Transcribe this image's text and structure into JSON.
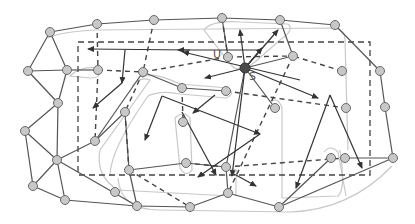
{
  "diagram": {
    "title": "",
    "labels": [
      {
        "id": "U",
        "text": "U",
        "x": 217,
        "y": 55
      },
      {
        "id": "S",
        "text": "S",
        "x": 251,
        "y": 76
      }
    ],
    "colors": {
      "node_fill": "#c8c8c8",
      "node_stroke": "#6a6a6a",
      "highlight_node": "#4a4a4a",
      "edge": "#555555",
      "dashed": "#444444",
      "arrow": "#333333",
      "contour": "#c4c4c4"
    },
    "dashed_rect": {
      "x1": 78,
      "y1": 42,
      "x2": 370,
      "y2": 175
    },
    "nodes": [
      {
        "id": "n1",
        "x": 50,
        "y": 32
      },
      {
        "id": "n2",
        "x": 97,
        "y": 24
      },
      {
        "id": "n3",
        "x": 154,
        "y": 20
      },
      {
        "id": "n4",
        "x": 222,
        "y": 18
      },
      {
        "id": "n5",
        "x": 280,
        "y": 20
      },
      {
        "id": "n6",
        "x": 335,
        "y": 25
      },
      {
        "id": "n7",
        "x": 28,
        "y": 71
      },
      {
        "id": "n8",
        "x": 67,
        "y": 70
      },
      {
        "id": "n9",
        "x": 98,
        "y": 70
      },
      {
        "id": "n10",
        "x": 143,
        "y": 72
      },
      {
        "id": "n11",
        "x": 58,
        "y": 103
      },
      {
        "id": "n12",
        "x": 228,
        "y": 57
      },
      {
        "id": "n13",
        "x": 245,
        "y": 68
      },
      {
        "id": "n14",
        "x": 293,
        "y": 56
      },
      {
        "id": "n15",
        "x": 182,
        "y": 88
      },
      {
        "id": "n16",
        "x": 226,
        "y": 91
      },
      {
        "id": "n17",
        "x": 275,
        "y": 108
      },
      {
        "id": "n18",
        "x": 342,
        "y": 71
      },
      {
        "id": "n19",
        "x": 346,
        "y": 108
      },
      {
        "id": "n20",
        "x": 125,
        "y": 112
      },
      {
        "id": "n21",
        "x": 95,
        "y": 141
      },
      {
        "id": "n22",
        "x": 183,
        "y": 122
      },
      {
        "id": "n23",
        "x": 25,
        "y": 131
      },
      {
        "id": "n24",
        "x": 57,
        "y": 160
      },
      {
        "id": "n25",
        "x": 33,
        "y": 186
      },
      {
        "id": "n26",
        "x": 65,
        "y": 200
      },
      {
        "id": "n27",
        "x": 115,
        "y": 192
      },
      {
        "id": "n28",
        "x": 129,
        "y": 170
      },
      {
        "id": "n29",
        "x": 186,
        "y": 163
      },
      {
        "id": "n30",
        "x": 137,
        "y": 206
      },
      {
        "id": "n31",
        "x": 190,
        "y": 207
      },
      {
        "id": "n32",
        "x": 226,
        "y": 167
      },
      {
        "id": "n33",
        "x": 228,
        "y": 193
      },
      {
        "id": "n34",
        "x": 279,
        "y": 207
      },
      {
        "id": "n35",
        "x": 331,
        "y": 158
      },
      {
        "id": "n36",
        "x": 345,
        "y": 158
      },
      {
        "id": "n37",
        "x": 380,
        "y": 71
      },
      {
        "id": "n38",
        "x": 385,
        "y": 107
      },
      {
        "id": "n39",
        "x": 393,
        "y": 158
      }
    ],
    "solid_edges": [
      [
        "n1",
        "n2"
      ],
      [
        "n2",
        "n3"
      ],
      [
        "n3",
        "n4"
      ],
      [
        "n4",
        "n5"
      ],
      [
        "n5",
        "n6"
      ],
      [
        "n6",
        "n37"
      ],
      [
        "n37",
        "n38"
      ],
      [
        "n38",
        "n39"
      ],
      [
        "n39",
        "n34"
      ],
      [
        "n34",
        "n33"
      ],
      [
        "n33",
        "n31"
      ],
      [
        "n31",
        "n30"
      ],
      [
        "n30",
        "n26"
      ],
      [
        "n26",
        "n25"
      ],
      [
        "n1",
        "n7"
      ],
      [
        "n1",
        "n8"
      ],
      [
        "n7",
        "n8"
      ],
      [
        "n7",
        "n11"
      ],
      [
        "n8",
        "n11"
      ],
      [
        "n8",
        "n9"
      ],
      [
        "n11",
        "n23"
      ],
      [
        "n11",
        "n24"
      ],
      [
        "n23",
        "n24"
      ],
      [
        "n23",
        "n25"
      ],
      [
        "n24",
        "n25"
      ],
      [
        "n24",
        "n26"
      ],
      [
        "n24",
        "n21"
      ],
      [
        "n24",
        "n30"
      ],
      [
        "n21",
        "n10"
      ],
      [
        "n10",
        "n15"
      ],
      [
        "n15",
        "n16"
      ],
      [
        "n20",
        "n21"
      ],
      [
        "n20",
        "n28"
      ],
      [
        "n4",
        "n12"
      ],
      [
        "n5",
        "n14"
      ],
      [
        "n14",
        "n13"
      ],
      [
        "n13",
        "n17"
      ],
      [
        "n13",
        "n32"
      ],
      [
        "n29",
        "n28"
      ],
      [
        "n29",
        "n32"
      ],
      [
        "n28",
        "n30"
      ],
      [
        "n32",
        "n33"
      ],
      [
        "n35",
        "n34"
      ],
      [
        "n36",
        "n39"
      ]
    ],
    "dashed_edges": [
      [
        "n2",
        "n9"
      ],
      [
        "n9",
        "n10"
      ],
      [
        "n3",
        "n10"
      ],
      [
        "n10",
        "n20"
      ],
      [
        "n12",
        "n14"
      ],
      [
        "n15",
        "n22"
      ],
      [
        "n12",
        "n10"
      ],
      [
        "n9",
        "n21"
      ],
      [
        "n20",
        "n28"
      ],
      [
        "n18",
        "n14"
      ],
      [
        "n14",
        "n33"
      ],
      [
        "n16",
        "n19"
      ],
      [
        "n29",
        "n32"
      ],
      [
        "n32",
        "n36"
      ],
      [
        "n28",
        "n31"
      ],
      [
        "n4",
        "n12"
      ]
    ],
    "arrows": [
      {
        "from": [
          190,
          50
        ],
        "to": [
          88,
          49
        ]
      },
      {
        "from": [
          300,
          80
        ],
        "to": [
          183,
          52
        ]
      },
      {
        "from": [
          125,
          50
        ],
        "to": [
          122,
          83
        ]
      },
      {
        "from": [
          122,
          83
        ],
        "to": [
          93,
          108
        ]
      },
      {
        "from": [
          245,
          68
        ],
        "to": [
          278,
          30
        ]
      },
      {
        "from": [
          245,
          68
        ],
        "to": [
          240,
          30
        ]
      },
      {
        "from": [
          245,
          68
        ],
        "to": [
          262,
          48
        ]
      },
      {
        "from": [
          245,
          68
        ],
        "to": [
          205,
          78
        ]
      },
      {
        "from": [
          245,
          68
        ],
        "to": [
          318,
          98
        ]
      },
      {
        "from": [
          245,
          68
        ],
        "to": [
          232,
          176
        ]
      },
      {
        "from": [
          330,
          95
        ],
        "to": [
          362,
          168
        ]
      },
      {
        "from": [
          330,
          95
        ],
        "to": [
          296,
          188
        ]
      },
      {
        "from": [
          162,
          96
        ],
        "to": [
          260,
          134
        ]
      },
      {
        "from": [
          162,
          96
        ],
        "to": [
          145,
          140
        ]
      },
      {
        "from": [
          260,
          134
        ],
        "to": [
          198,
          177
        ]
      },
      {
        "from": [
          182,
          112
        ],
        "to": [
          216,
          175
        ]
      },
      {
        "from": [
          234,
          174
        ],
        "to": [
          256,
          186
        ]
      },
      {
        "from": [
          215,
          95
        ],
        "to": [
          193,
          113
        ]
      },
      {
        "from": [
          260,
          50
        ],
        "to": [
          178,
          50
        ]
      }
    ]
  }
}
